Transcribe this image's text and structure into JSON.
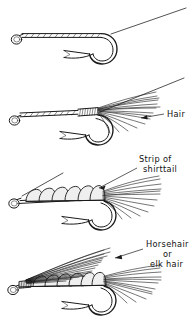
{
  "figure": {
    "kind": "line-art-instructional-diagram",
    "background_color": "#ffffff",
    "ink_color": "#1a1a1a",
    "panel_count": 4,
    "labels": {
      "hair": "Hair",
      "strip_line1": "Strip of",
      "strip_line2": "shirttail",
      "horsehair_line1": "Horsehair",
      "horsehair_line2": "or",
      "horsehair_line3": "elk hair"
    },
    "steps": [
      {
        "index": 1,
        "name": "thread-base",
        "description": "Bare hook with thread wrapped along shank, tag thread running to upper right",
        "label": ""
      },
      {
        "index": 2,
        "name": "tie-in-hair",
        "description": "Hair tail tied in at rear of shank with dense thread wraps",
        "label": "Hair"
      },
      {
        "index": 3,
        "name": "wrap-shirttail-body",
        "description": "Strip of shirttail wrapped forward forming segmented body",
        "label": "Strip of shirttail"
      },
      {
        "index": 4,
        "name": "add-wing",
        "description": "Horsehair or elk hair wing tied at head sweeping back over body",
        "label": "Horsehair or elk hair"
      }
    ]
  }
}
